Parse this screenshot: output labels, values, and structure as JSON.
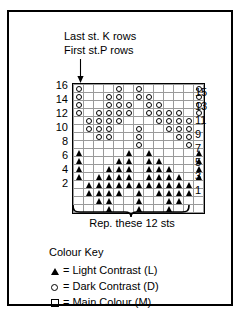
{
  "annotations": {
    "line1": "Last st. K rows",
    "line2": "First st.P rows",
    "arrow_icon": "down-arrow-icon"
  },
  "chart_data": {
    "type": "heatmap",
    "columns": 13,
    "rows": 16,
    "xlabel": "",
    "ylabel": "",
    "legend_position": "below",
    "grid": true,
    "symbols": {
      "L": "triangle",
      "D": "circle",
      "M": "empty"
    },
    "row_labels_left": [
      "16",
      "",
      "14",
      "",
      "12",
      "",
      "10",
      "",
      "8",
      "",
      "6",
      "",
      "4",
      "",
      "2",
      ""
    ],
    "row_labels_right": [
      "",
      "15",
      "",
      "13",
      "",
      "11",
      "",
      "9",
      "",
      "7",
      "",
      "5",
      "",
      "3",
      "",
      "1"
    ],
    "cells": [
      [
        "D",
        "M",
        "M",
        "M",
        "D",
        "M",
        "D",
        "M",
        "M",
        "M",
        "M",
        "M",
        "D"
      ],
      [
        "D",
        "M",
        "M",
        "D",
        "D",
        "M",
        "D",
        "D",
        "M",
        "M",
        "M",
        "M",
        "D"
      ],
      [
        "D",
        "M",
        "M",
        "D",
        "D",
        "D",
        "M",
        "D",
        "D",
        "M",
        "M",
        "M",
        "D"
      ],
      [
        "D",
        "M",
        "D",
        "D",
        "D",
        "D",
        "M",
        "D",
        "D",
        "D",
        "D",
        "M",
        "D"
      ],
      [
        "M",
        "D",
        "D",
        "D",
        "D",
        "M",
        "M",
        "M",
        "D",
        "D",
        "D",
        "D",
        "M"
      ],
      [
        "M",
        "D",
        "D",
        "D",
        "M",
        "M",
        "D",
        "M",
        "M",
        "D",
        "D",
        "D",
        "M"
      ],
      [
        "M",
        "M",
        "D",
        "D",
        "M",
        "M",
        "D",
        "M",
        "M",
        "M",
        "D",
        "D",
        "M"
      ],
      [
        "M",
        "M",
        "M",
        "M",
        "M",
        "M",
        "D",
        "M",
        "M",
        "M",
        "M",
        "D",
        "M"
      ],
      [
        "L",
        "M",
        "M",
        "M",
        "M",
        "L",
        "M",
        "L",
        "M",
        "M",
        "M",
        "M",
        "L"
      ],
      [
        "L",
        "M",
        "M",
        "M",
        "L",
        "L",
        "M",
        "L",
        "L",
        "M",
        "M",
        "M",
        "L"
      ],
      [
        "L",
        "M",
        "M",
        "L",
        "L",
        "L",
        "M",
        "L",
        "L",
        "L",
        "M",
        "M",
        "L"
      ],
      [
        "L",
        "M",
        "L",
        "L",
        "L",
        "L",
        "M",
        "L",
        "L",
        "L",
        "L",
        "M",
        "L"
      ],
      [
        "M",
        "L",
        "L",
        "L",
        "L",
        "L",
        "L",
        "L",
        "L",
        "L",
        "L",
        "L",
        "M"
      ],
      [
        "M",
        "L",
        "L",
        "L",
        "L",
        "M",
        "L",
        "M",
        "L",
        "L",
        "L",
        "L",
        "M"
      ],
      [
        "M",
        "M",
        "L",
        "L",
        "M",
        "M",
        "L",
        "M",
        "M",
        "L",
        "L",
        "M",
        "M"
      ],
      [
        "M",
        "M",
        "M",
        "L",
        "M",
        "M",
        "L",
        "M",
        "M",
        "L",
        "M",
        "M",
        "M"
      ]
    ]
  },
  "repeat": {
    "label": "Rep. these 12 sts",
    "count": 12,
    "bracket_icon": "repeat-bracket-icon"
  },
  "legend": {
    "title": "Colour Key",
    "entries": [
      {
        "glyph": "triangle-icon",
        "equals": "=",
        "label": "Light Contrast (L)"
      },
      {
        "glyph": "circle-icon",
        "equals": "=",
        "label": "Dark Contrast (D)"
      },
      {
        "glyph": "square-icon",
        "equals": "=",
        "label": "Main Colour (M)"
      }
    ]
  },
  "colors": {
    "ink": "#000000",
    "background": "#ffffff",
    "gridline": "#9a9a9a"
  }
}
